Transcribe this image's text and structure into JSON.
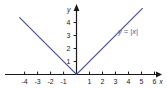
{
  "chart_data": {
    "type": "line",
    "title": "",
    "subtitle": "",
    "xlabel": "x",
    "ylabel": "y",
    "xlim": [
      -4.8,
      6.6
    ],
    "ylim": [
      -0.9,
      5.0
    ],
    "xticks": [
      -4,
      -3,
      -2,
      -1,
      1,
      2,
      3,
      4,
      5,
      6
    ],
    "xtick_labels": [
      "-4",
      "-3",
      "-2",
      "-1",
      "1",
      "2",
      "3",
      "4",
      "5",
      "6"
    ],
    "yticks": [
      1,
      2,
      3,
      4
    ],
    "ytick_labels": [
      "1",
      "2",
      "3",
      "4"
    ],
    "grid": false,
    "legend_position": "none",
    "annotations": [
      {
        "name": "curve-equation-label",
        "text": "y = |x|",
        "x": 5.0,
        "y": 3.3,
        "color": "#4a57a8"
      }
    ],
    "series": [
      {
        "name": "y = |x|",
        "color": "#46529c",
        "x": [
          -4.4,
          0,
          5.1
        ],
        "values": [
          4.4,
          0,
          5.1
        ]
      }
    ]
  },
  "colors": {
    "background": "#ffffff",
    "axis": "#1a1a1a",
    "curve": "#46529c",
    "label": "#4a57a8",
    "tick_text": "#1a1a1a"
  },
  "axes": {
    "x_axis_name": "x",
    "y_axis_name": "y",
    "x_arrow": "arrow-right",
    "y_arrow": "arrow-up"
  }
}
